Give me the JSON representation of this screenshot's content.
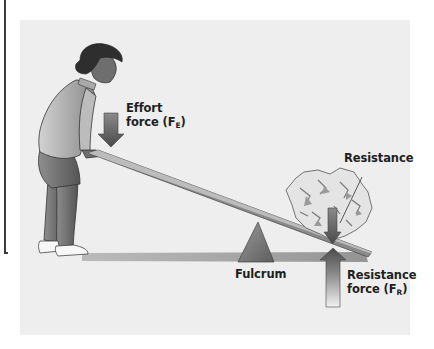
{
  "diagram": {
    "labels": {
      "effort_line1": "Effort",
      "effort_line2": "force (F",
      "effort_sub": "E",
      "effort_close": ")",
      "resistance": "Resistance",
      "fulcrum": "Fulcrum",
      "resistance_force_line1": "Resistance",
      "resistance_force_line2": "force (F",
      "resistance_force_sub": "R",
      "resistance_force_close": ")"
    },
    "elements": {
      "person": "person pushing down on lever",
      "lever": "plank",
      "fulcrum": "triangle pivot",
      "load": "rock"
    },
    "colors": {
      "panel": "#eeeeee",
      "arrow_dark": "#5a5a5a",
      "arrow_light": "#d8d8d8",
      "text": "#1e1e1e"
    }
  }
}
